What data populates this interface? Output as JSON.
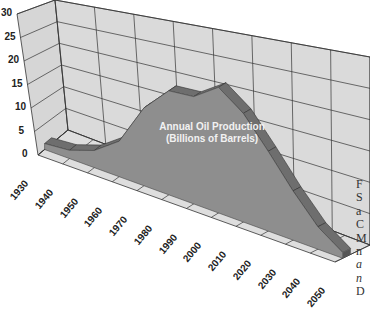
{
  "chart_data": {
    "type": "area",
    "style": "3d",
    "title": "",
    "series_label": [
      "Annual Oil Production",
      "(Billions of Barrels)"
    ],
    "xlabel": "",
    "ylabel": "",
    "categories": [
      "1930",
      "1940",
      "1950",
      "1960",
      "1970",
      "1980",
      "1990",
      "2000",
      "2010",
      "2020",
      "2030",
      "2040",
      "2050"
    ],
    "series": [
      {
        "name": "Annual Oil Production (Billions of Barrels)",
        "values": [
          1.5,
          2,
          4,
          8,
          17,
          22,
          22,
          25,
          21,
          15,
          9,
          4,
          1
        ]
      }
    ],
    "y_ticks": [
      "0",
      "5",
      "10",
      "15",
      "20",
      "25",
      "30"
    ],
    "ylim": [
      0,
      30
    ],
    "grid": true,
    "legend": "none"
  },
  "side_text_fragments": [
    "F",
    "S",
    "a",
    "C",
    "M",
    "n",
    "a",
    "n",
    "D"
  ]
}
